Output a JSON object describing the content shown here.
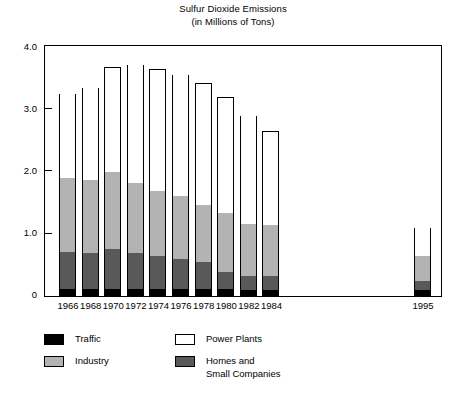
{
  "chart_data": {
    "type": "bar",
    "subtype": "stacked-bar",
    "title": "Sulfur Dioxide Emissions",
    "subtitle": "(in Millions of Tons)",
    "xlabel": "",
    "ylabel": "",
    "ylim": [
      0,
      4.0
    ],
    "yticks": [
      0,
      1.0,
      2.0,
      3.0,
      4.0
    ],
    "ytick_labels": [
      "0",
      "1.0",
      "2.0",
      "3.0",
      "4.0"
    ],
    "grid": false,
    "legend_position": "below-plot",
    "categories": [
      "1966",
      "1968",
      "1970",
      "1972",
      "1974",
      "1976",
      "1978",
      "1980",
      "1982",
      "1984",
      "1995"
    ],
    "stack_order_bottom_to_top": [
      "Traffic",
      "Homes and Small Companies",
      "Industry",
      "Power Plants"
    ],
    "series": [
      {
        "name": "Traffic",
        "color": "#000000",
        "values": [
          0.13,
          0.13,
          0.13,
          0.13,
          0.13,
          0.12,
          0.12,
          0.12,
          0.11,
          0.11,
          0.1
        ]
      },
      {
        "name": "Homes and Small Companies",
        "color": "#595959",
        "values": [
          0.59,
          0.57,
          0.64,
          0.57,
          0.52,
          0.49,
          0.43,
          0.27,
          0.22,
          0.22,
          0.15
        ]
      },
      {
        "name": "Industry",
        "color": "#b3b3b3",
        "values": [
          1.18,
          1.18,
          1.23,
          1.12,
          1.05,
          1.0,
          0.93,
          0.95,
          0.83,
          0.82,
          0.4
        ]
      },
      {
        "name": "Power Plants",
        "color": "#ffffff",
        "values": [
          1.35,
          1.47,
          1.68,
          1.9,
          1.95,
          1.95,
          1.94,
          1.86,
          1.74,
          1.5,
          0.45
        ]
      }
    ],
    "totals": [
      3.25,
      3.35,
      3.68,
      3.72,
      3.65,
      3.56,
      3.42,
      3.2,
      2.9,
      2.65,
      1.1
    ],
    "segment_tops": {
      "1966": {
        "traffic": 0.13,
        "homes": 0.72,
        "industry": 1.9,
        "power": 3.25
      },
      "1968": {
        "traffic": 0.13,
        "homes": 0.7,
        "industry": 1.88,
        "power": 3.35
      },
      "1970": {
        "traffic": 0.13,
        "homes": 0.77,
        "industry": 2.0,
        "power": 3.68
      },
      "1972": {
        "traffic": 0.13,
        "homes": 0.7,
        "industry": 1.82,
        "power": 3.72
      },
      "1974": {
        "traffic": 0.13,
        "homes": 0.65,
        "industry": 1.7,
        "power": 3.65
      },
      "1976": {
        "traffic": 0.12,
        "homes": 0.61,
        "industry": 1.61,
        "power": 3.56
      },
      "1978": {
        "traffic": 0.12,
        "homes": 0.55,
        "industry": 1.48,
        "power": 3.42
      },
      "1980": {
        "traffic": 0.12,
        "homes": 0.39,
        "industry": 1.34,
        "power": 3.2
      },
      "1982": {
        "traffic": 0.11,
        "homes": 0.33,
        "industry": 1.16,
        "power": 2.9
      },
      "1984": {
        "traffic": 0.11,
        "homes": 0.33,
        "industry": 1.15,
        "power": 2.65
      },
      "1995": {
        "traffic": 0.1,
        "homes": 0.25,
        "industry": 0.65,
        "power": 1.1
      }
    }
  },
  "legend": {
    "items": [
      {
        "label": "Traffic",
        "color": "#000000",
        "column": 0,
        "row": 0
      },
      {
        "label": "Industry",
        "color": "#b3b3b3",
        "column": 0,
        "row": 1
      },
      {
        "label": "Power Plants",
        "color": "#ffffff",
        "column": 1,
        "row": 0
      },
      {
        "label": "Homes and\nSmall Companies",
        "color": "#595959",
        "column": 1,
        "row": 1
      }
    ]
  },
  "colors": {
    "traffic": "#000000",
    "homes": "#595959",
    "industry": "#b3b3b3",
    "power_plants": "#ffffff",
    "axis": "#000000",
    "background": "#ffffff"
  }
}
